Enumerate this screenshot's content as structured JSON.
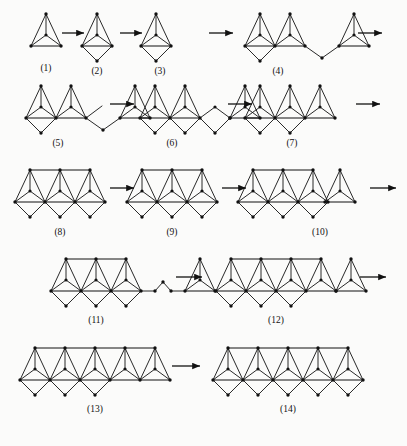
{
  "page": {
    "background_color": "#fbfbfa",
    "ink_color": "#111111",
    "width": 407,
    "height": 446
  },
  "legend": {
    "unit_description": "apex vertex with interior vertex fanned to two base vertices",
    "diamond_description": "downward rhombus hanging below the baseline",
    "arrow_glyph": "arrow-right"
  },
  "figures": [
    {
      "id": 1,
      "label": "(1)",
      "row": 1,
      "cx": 46,
      "units": 1,
      "diamonds": 0,
      "top_bar": false,
      "tail": "none",
      "label_x": 46,
      "label_y": 71
    },
    {
      "id": 2,
      "label": "(2)",
      "row": 1,
      "cx": 97,
      "units": 1,
      "diamonds": 1,
      "top_bar": false,
      "tail": "none",
      "label_x": 97,
      "label_y": 74
    },
    {
      "id": 3,
      "label": "(3)",
      "row": 1,
      "cx": 156,
      "units": 1,
      "diamonds": 1,
      "top_bar": false,
      "tail": "none",
      "label_x": 160,
      "label_y": 74
    },
    {
      "id": 4,
      "label": "(4)",
      "row": 1,
      "cx": 275,
      "units": 2,
      "diamonds": 1,
      "top_bar": false,
      "tail": "vee",
      "label_x": 278,
      "label_y": 74
    },
    {
      "id": 5,
      "label": "(5)",
      "row": 2,
      "cx": 56,
      "units": 2,
      "diamonds": 1,
      "top_bar": false,
      "tail": "zigzag",
      "label_x": 58,
      "label_y": 146
    },
    {
      "id": 6,
      "label": "(6)",
      "row": 2,
      "cx": 170,
      "units": 2,
      "diamonds": 2,
      "top_bar": false,
      "tail": "diamond",
      "label_x": 172,
      "label_y": 146
    },
    {
      "id": 7,
      "label": "(7)",
      "row": 2,
      "cx": 290,
      "units": 3,
      "diamonds": 2,
      "top_bar": false,
      "tail": "none",
      "label_x": 292,
      "label_y": 146
    },
    {
      "id": 8,
      "label": "(8)",
      "row": 3,
      "cx": 60,
      "units": 3,
      "diamonds": 3,
      "top_bar": true,
      "tail": "none",
      "label_x": 60,
      "label_y": 235
    },
    {
      "id": 9,
      "label": "(9)",
      "row": 3,
      "cx": 172,
      "units": 3,
      "diamonds": 3,
      "top_bar": true,
      "tail": "none",
      "label_x": 172,
      "label_y": 235
    },
    {
      "id": 10,
      "label": "(10)",
      "row": 3,
      "cx": 283,
      "units": 3,
      "diamonds": 3,
      "top_bar": true,
      "tail": "single",
      "label_x": 320,
      "label_y": 235
    },
    {
      "id": 11,
      "label": "(11)",
      "row": 4,
      "cx": 96,
      "units": 3,
      "diamonds": 3,
      "top_bar": true,
      "tail": "zigzag2",
      "label_x": 96,
      "label_y": 323
    },
    {
      "id": 12,
      "label": "(12)",
      "row": 4,
      "cx": 276,
      "units": 4,
      "diamonds": 3,
      "top_bar": true,
      "tail": "extra",
      "label_x": 276,
      "label_y": 323
    },
    {
      "id": 13,
      "label": "(13)",
      "row": 5,
      "cx": 95,
      "units": 5,
      "diamonds": 3,
      "top_bar": true,
      "tail": "none",
      "label_x": 95,
      "label_y": 412
    },
    {
      "id": 14,
      "label": "(14)",
      "row": 5,
      "cx": 288,
      "units": 5,
      "diamonds": 5,
      "top_bar": true,
      "tail": "none",
      "label_x": 288,
      "label_y": 412
    }
  ],
  "arrows": [
    {
      "id": "arrow-1",
      "x1": 62,
      "y1": 33,
      "x2": 84,
      "y2": 33
    },
    {
      "id": "arrow-2",
      "x1": 120,
      "y1": 33,
      "x2": 142,
      "y2": 33
    },
    {
      "id": "arrow-3",
      "x1": 209,
      "y1": 33,
      "x2": 233,
      "y2": 33
    },
    {
      "id": "arrow-4",
      "x1": 358,
      "y1": 33,
      "x2": 382,
      "y2": 33
    },
    {
      "id": "arrow-5",
      "x1": 110,
      "y1": 104,
      "x2": 134,
      "y2": 104
    },
    {
      "id": "arrow-6",
      "x1": 228,
      "y1": 104,
      "x2": 252,
      "y2": 104
    },
    {
      "id": "arrow-7",
      "x1": 356,
      "y1": 104,
      "x2": 380,
      "y2": 104
    },
    {
      "id": "arrow-8",
      "x1": 110,
      "y1": 188,
      "x2": 134,
      "y2": 188
    },
    {
      "id": "arrow-9",
      "x1": 222,
      "y1": 188,
      "x2": 246,
      "y2": 188
    },
    {
      "id": "arrow-10",
      "x1": 370,
      "y1": 188,
      "x2": 396,
      "y2": 188
    },
    {
      "id": "arrow-11",
      "x1": 176,
      "y1": 277,
      "x2": 202,
      "y2": 277
    },
    {
      "id": "arrow-12",
      "x1": 360,
      "y1": 277,
      "x2": 386,
      "y2": 277
    },
    {
      "id": "arrow-13",
      "x1": 172,
      "y1": 366,
      "x2": 200,
      "y2": 366
    }
  ],
  "rows": [
    {
      "index": 1,
      "baseline_y": 46,
      "apex_y": 14
    },
    {
      "index": 2,
      "baseline_y": 118,
      "apex_y": 86
    },
    {
      "index": 3,
      "baseline_y": 202,
      "apex_y": 170
    },
    {
      "index": 4,
      "baseline_y": 291,
      "apex_y": 259
    },
    {
      "index": 5,
      "baseline_y": 380,
      "apex_y": 348
    }
  ]
}
